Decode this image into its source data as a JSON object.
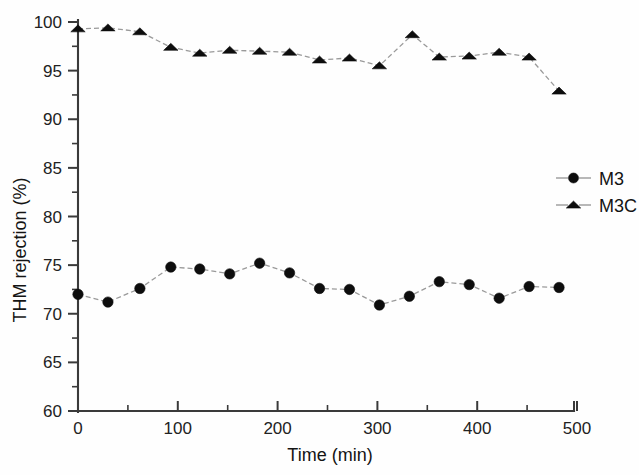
{
  "chart_data": {
    "type": "line",
    "title": "",
    "xlabel": "Time (min)",
    "ylabel": "THM rejection (%)",
    "xlim": [
      0,
      520
    ],
    "ylim": [
      60,
      100
    ],
    "xticks": [
      0,
      100,
      200,
      300,
      400,
      500
    ],
    "xtick_labels": [
      "0",
      "100",
      "200",
      "300",
      "400",
      "500"
    ],
    "xminor_ticks": [
      50,
      150,
      250,
      350,
      450
    ],
    "yticks": [
      60,
      65,
      70,
      75,
      80,
      85,
      90,
      95,
      100
    ],
    "ytick_labels": [
      "60",
      "65",
      "70",
      "75",
      "80",
      "85",
      "90",
      "95",
      "100"
    ],
    "yminor_ticks": [
      62.5,
      67.5,
      72.5,
      77.5,
      82.5,
      87.5,
      92.5,
      97.5
    ],
    "grid": false,
    "legend_position": "right-middle",
    "line_style": "dashed",
    "line_color": "#9a9a9a",
    "marker_color": "#0d0d0d",
    "series": [
      {
        "name": "M3",
        "marker": "circle",
        "x": [
          0,
          30,
          62,
          93,
          122,
          152,
          182,
          212,
          242,
          272,
          302,
          332,
          362,
          392,
          422,
          452,
          482
        ],
        "values": [
          72.0,
          71.2,
          72.6,
          74.8,
          74.6,
          74.1,
          75.2,
          74.2,
          72.6,
          72.5,
          70.9,
          71.8,
          73.3,
          73.0,
          71.6,
          72.8,
          72.7
        ]
      },
      {
        "name": "M3C",
        "marker": "triangle",
        "x": [
          0,
          30,
          62,
          93,
          122,
          152,
          182,
          212,
          242,
          272,
          302,
          335,
          362,
          392,
          422,
          452,
          482
        ],
        "values": [
          99.3,
          99.4,
          99.0,
          97.4,
          96.8,
          97.1,
          97.0,
          96.9,
          96.1,
          96.3,
          95.5,
          98.7,
          96.4,
          96.5,
          96.9,
          96.4,
          92.9
        ]
      }
    ]
  },
  "legend": {
    "entries": [
      {
        "label": "M3",
        "marker": "circle-marker"
      },
      {
        "label": "M3C",
        "marker": "triangle-marker"
      }
    ]
  },
  "axes": {
    "x_title": "Time (min)",
    "y_title": "THM rejection (%)"
  }
}
